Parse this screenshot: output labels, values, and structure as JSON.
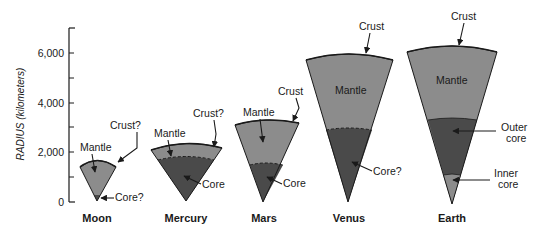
{
  "figure": {
    "axis": {
      "title": "RADIUS  (kilometers)",
      "ticks": [
        "0",
        "2,000",
        "4,000",
        "6,000"
      ],
      "range_km": [
        0,
        7000
      ]
    },
    "colors": {
      "mantle": "#8c8c8c",
      "core": "#4a4a4a",
      "inner_core": "#8c8c8c",
      "outline": "#1a1a1a",
      "background": "#ffffff"
    },
    "planets": [
      {
        "name": "Moon",
        "labels": {
          "mantle": "Mantle",
          "crust": "Crust?",
          "core": "Core?"
        },
        "approx_radius_km": 1740,
        "approx_core_radius_km": 300
      },
      {
        "name": "Mercury",
        "labels": {
          "mantle": "Mantle",
          "crust": "Crust?",
          "core": "Core"
        },
        "approx_radius_km": 2440,
        "approx_core_radius_km": 1800
      },
      {
        "name": "Mars",
        "labels": {
          "mantle": "Mantle",
          "crust": "Crust",
          "core": "Core"
        },
        "approx_radius_km": 3390,
        "approx_core_radius_km": 1500
      },
      {
        "name": "Venus",
        "labels": {
          "mantle": "Mantle",
          "crust": "Crust",
          "core": "Core?"
        },
        "approx_radius_km": 6050,
        "approx_core_radius_km": 3000
      },
      {
        "name": "Earth",
        "labels": {
          "mantle": "Mantle",
          "crust": "Crust",
          "outer_core_line1": "Outer",
          "outer_core_line2": "core",
          "inner_core_line1": "Inner",
          "inner_core_line2": "core"
        },
        "approx_radius_km": 6370,
        "approx_core_radius_km": 3480,
        "approx_inner_core_radius_km": 1220
      }
    ]
  }
}
